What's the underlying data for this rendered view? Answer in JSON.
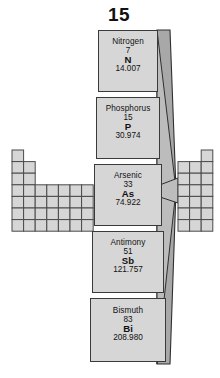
{
  "title": {
    "group_number": "15"
  },
  "colors": {
    "card_fill": "#d6d6d6",
    "card_border": "#3a3a3a",
    "funnel_front": "#c9c9c9",
    "funnel_side": "#8f8f8f",
    "funnel_edge": "#2f2f2f",
    "grid_fill": "#d6d6d6",
    "grid_line": "#4a4a4a",
    "text": "#111111",
    "background": "#ffffff"
  },
  "elements": [
    {
      "name": "Nitrogen",
      "number": "7",
      "symbol": "N",
      "mass": "14.007",
      "period": 2
    },
    {
      "name": "Phosphorus",
      "number": "15",
      "symbol": "P",
      "mass": "30.974",
      "period": 3
    },
    {
      "name": "Arsenic",
      "number": "33",
      "symbol": "As",
      "mass": "74.922",
      "period": 4
    },
    {
      "name": "Antimony",
      "number": "51",
      "symbol": "Sb",
      "mass": "121.757",
      "period": 5
    },
    {
      "name": "Bismuth",
      "number": "83",
      "symbol": "Bi",
      "mass": "208.980",
      "period": 6
    }
  ],
  "periodic_table": {
    "left_block": {
      "description": "s-block and d-block cells left of group 15",
      "cell_width": 11.6,
      "cell_height": 11.6,
      "origin_x": 12,
      "origin_y": 150,
      "rows": [
        {
          "start_col": 0,
          "count": 1
        },
        {
          "start_col": 0,
          "count": 2
        },
        {
          "start_col": 0,
          "count": 2
        },
        {
          "start_col": 0,
          "count": 7
        },
        {
          "start_col": 0,
          "count": 7
        },
        {
          "start_col": 0,
          "count": 7
        },
        {
          "start_col": 0,
          "count": 7
        }
      ]
    },
    "right_block": {
      "description": "p-block cells right of group 15",
      "cell_width": 11.6,
      "cell_height": 11.6,
      "origin_x": 178,
      "origin_y": 150,
      "rows": [
        {
          "start_col": 2,
          "count": 1
        },
        {
          "start_col": 0,
          "count": 3
        },
        {
          "start_col": 0,
          "count": 3
        },
        {
          "start_col": 0,
          "count": 3
        },
        {
          "start_col": 0,
          "count": 3
        },
        {
          "start_col": 0,
          "count": 3
        },
        {
          "start_col": 0,
          "count": 3
        }
      ]
    }
  }
}
